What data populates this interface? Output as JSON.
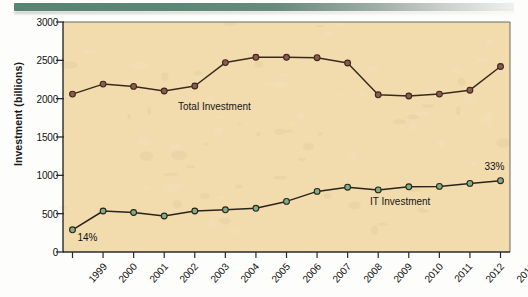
{
  "page": {
    "top_rule_color": "#53806e"
  },
  "chart_data": {
    "type": "line",
    "title": "",
    "xlabel": "",
    "ylabel": "Investment (billions)",
    "categories": [
      "1999",
      "2000",
      "2001",
      "2002",
      "2003",
      "2004",
      "2005",
      "2006",
      "2007",
      "2008",
      "2009",
      "2010",
      "2011",
      "2012",
      "2013"
    ],
    "ylim": [
      0,
      3000
    ],
    "yticks": [
      0,
      500,
      1000,
      1500,
      2000,
      2500,
      3000
    ],
    "ytick_labels": [
      "0",
      "500",
      "1000",
      "1500",
      "2000",
      "2500",
      "3000"
    ],
    "grid": false,
    "legend": "inline-labels",
    "plot_bg_color": "#f2dcae",
    "series": [
      {
        "name": "Total Investment",
        "color": "#8c5a50",
        "line_color": "#3a2a1c",
        "marker": "circle",
        "values": [
          2060,
          2190,
          2160,
          2100,
          2165,
          2470,
          2540,
          2540,
          2535,
          2465,
          2050,
          2035,
          2060,
          2110,
          2420
        ]
      },
      {
        "name": "IT Investment",
        "color": "#7fae8c",
        "line_color": "#2b2417",
        "marker": "circle",
        "values": [
          290,
          535,
          515,
          470,
          535,
          550,
          570,
          660,
          790,
          845,
          810,
          850,
          855,
          895,
          930
        ]
      }
    ],
    "annotations": [
      {
        "text": "14%",
        "series": "IT Investment",
        "category": "1999"
      },
      {
        "text": "33%",
        "series": "IT Investment",
        "category": "2013"
      }
    ],
    "series_labels": [
      {
        "text": "Total Investment",
        "series": "Total Investment"
      },
      {
        "text": "IT Investment",
        "series": "IT Investment"
      }
    ]
  }
}
